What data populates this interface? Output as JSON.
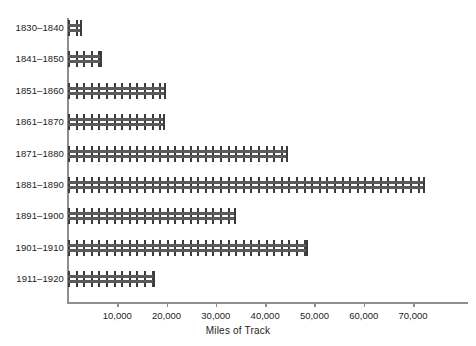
{
  "chart_data": {
    "type": "bar",
    "orientation": "horizontal",
    "title": "",
    "xlabel": "Miles of Track",
    "ylabel": "",
    "categories": [
      "1830–1840",
      "1841–1850",
      "1851–1860",
      "1861–1870",
      "1871–1880",
      "1881–1890",
      "1891–1900",
      "1901–1910",
      "1911–1920"
    ],
    "values": [
      2800,
      6800,
      19900,
      19600,
      44600,
      72400,
      34100,
      48700,
      17600
    ],
    "xlim": [
      0,
      81000
    ],
    "xticks": [
      10000,
      20000,
      30000,
      40000,
      50000,
      60000,
      70000
    ],
    "xtick_labels": [
      "10,000",
      "20,000",
      "30,000",
      "40,000",
      "50,000",
      "60,000",
      "70,000"
    ],
    "grid": false,
    "legend": null,
    "bar_style": "railroad-track",
    "colors": {
      "rail": "#5a5a5a",
      "tie": "#3c3c3c",
      "axis": "#8e8e8e",
      "text": "#1c1c1c",
      "background": "#ffffff"
    }
  }
}
